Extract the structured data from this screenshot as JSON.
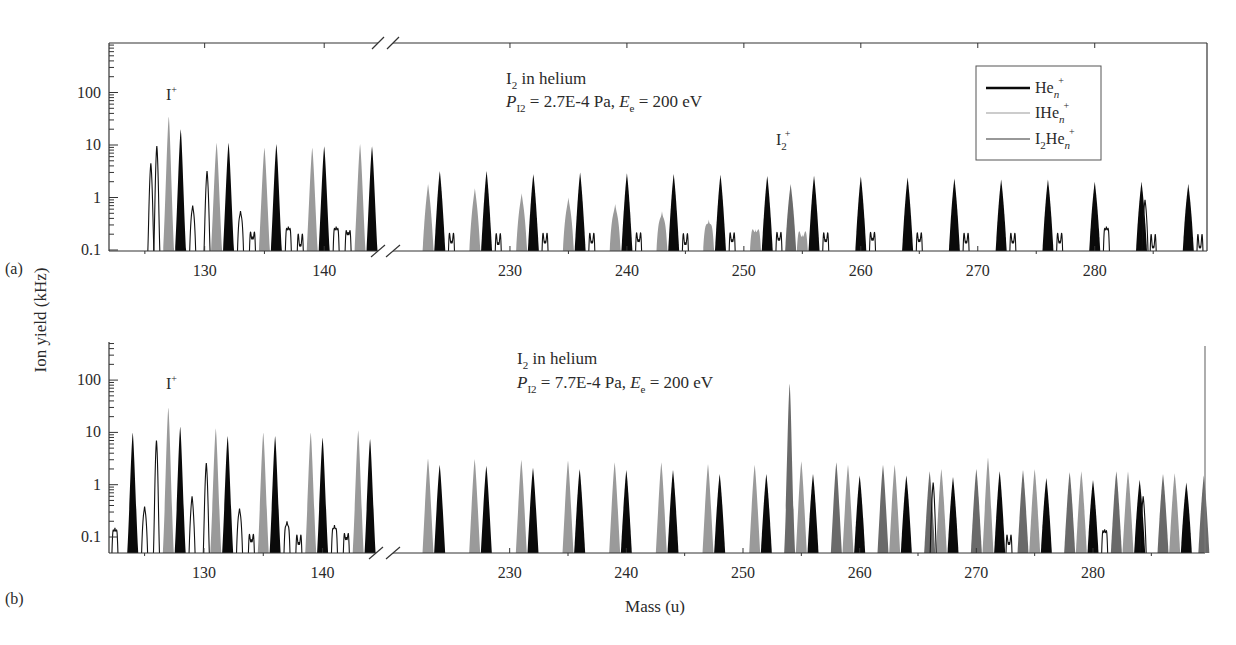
{
  "figure": {
    "ylabel": "Ion yield (kHz)",
    "xlabel": "Mass (u)",
    "colors": {
      "hen": "#0a0a0a",
      "ihen": "#9a9a9a",
      "i2hen": "#6a6a6a",
      "i2hen_outline": "#111111",
      "axis": "#333333"
    }
  },
  "legend": {
    "items": [
      {
        "label": "He",
        "sub": "n",
        "sup": "+",
        "color": "#0a0a0a",
        "width": 2.4
      },
      {
        "label": "IHe",
        "sub": "n",
        "sup": "+",
        "color": "#9a9a9a",
        "width": 1.2
      },
      {
        "label": "I",
        "sub2": "2",
        "label2": "He",
        "sub": "n",
        "sup": "+",
        "color": "#333333",
        "width": 1.2
      }
    ]
  },
  "chart_data": [
    {
      "panel": "(a)",
      "type": "area",
      "title": "I2 in helium",
      "subtitle": "P_I2 = 2.7E-4 Pa, E_e = 200 eV",
      "annotations": [
        "I+",
        "I2+"
      ],
      "xlabel": "Mass (u)",
      "ylabel": "Ion yield (kHz)",
      "yscale": "log",
      "ylim": [
        0.1,
        1000
      ],
      "yticks": [
        "0.1",
        "1",
        "10",
        "100"
      ],
      "x_segments": [
        [
          122,
          144.5
        ],
        [
          220,
          289.6
        ]
      ],
      "xticks": [
        130,
        140,
        230,
        240,
        250,
        260,
        270,
        280
      ],
      "series": [
        {
          "name": "He_n+",
          "style": "black",
          "points": [
            [
              128,
              20
            ],
            [
              132,
              11
            ],
            [
              136,
              10.5
            ],
            [
              140,
              9.5
            ],
            [
              144,
              9.5
            ],
            [
              224,
              3.2
            ],
            [
              228,
              3.2
            ],
            [
              232,
              2.8
            ],
            [
              236,
              3.0
            ],
            [
              240,
              2.9
            ],
            [
              244,
              2.8
            ],
            [
              248,
              2.7
            ],
            [
              252,
              2.6
            ],
            [
              256,
              2.6
            ],
            [
              260,
              2.5
            ],
            [
              264,
              2.4
            ],
            [
              268,
              2.3
            ],
            [
              272,
              2.2
            ],
            [
              276,
              2.2
            ],
            [
              280,
              2.0
            ],
            [
              284,
              2.0
            ],
            [
              288,
              1.8
            ]
          ]
        },
        {
          "name": "IHe_n+",
          "style": "lightgray",
          "points": [
            [
              127,
              35
            ],
            [
              131,
              11
            ],
            [
              135,
              9
            ],
            [
              139,
              9
            ],
            [
              143,
              10.5
            ],
            [
              223,
              1.8
            ],
            [
              227,
              1.5
            ],
            [
              231,
              1.2
            ],
            [
              235,
              1.0
            ],
            [
              239,
              0.75
            ],
            [
              243,
              0.55
            ],
            [
              247,
              0.38
            ],
            [
              251,
              0.25
            ],
            [
              255,
              0.2
            ]
          ]
        },
        {
          "name": "I2He_n+",
          "style": "outline",
          "points": [
            [
              125.5,
              4.5
            ],
            [
              126,
              9.5
            ],
            [
              129,
              0.7
            ],
            [
              130.2,
              3.2
            ],
            [
              133,
              0.55
            ],
            [
              134,
              0.18
            ],
            [
              137,
              0.28
            ],
            [
              138,
              0.13
            ],
            [
              141,
              0.28
            ],
            [
              142,
              0.22
            ],
            [
              225,
              0.15
            ],
            [
              229,
              0.14
            ],
            [
              233,
              0.15
            ],
            [
              237,
              0.15
            ],
            [
              241,
              0.16
            ],
            [
              245,
              0.14
            ],
            [
              249,
              0.16
            ],
            [
              253,
              0.17
            ],
            [
              257,
              0.16
            ],
            [
              261,
              0.17
            ],
            [
              265,
              0.16
            ],
            [
              269,
              0.15
            ],
            [
              273,
              0.15
            ],
            [
              277,
              0.15
            ],
            [
              281,
              0.28
            ],
            [
              285,
              0.12
            ],
            [
              289,
              0.12
            ]
          ]
        },
        {
          "name": "I2+",
          "style": "darkgray",
          "points": [
            [
              254,
              1.8
            ]
          ]
        },
        {
          "name": "I2+ side",
          "style": "outline",
          "points": [
            [
              284.3,
              0.9
            ]
          ]
        }
      ]
    },
    {
      "panel": "(b)",
      "type": "area",
      "title": "I2 in helium",
      "subtitle": "P_I2 = 7.7E-4 Pa, E_e = 200 eV",
      "annotations": [
        "I+"
      ],
      "xlabel": "Mass (u)",
      "ylabel": "Ion yield (kHz)",
      "yscale": "log",
      "ylim": [
        0.05,
        500
      ],
      "yticks": [
        "0.1",
        "1",
        "10",
        "100"
      ],
      "x_segments": [
        [
          122,
          144.5
        ],
        [
          220,
          289.6
        ]
      ],
      "xticks": [
        130,
        140,
        230,
        240,
        250,
        260,
        270,
        280
      ],
      "series": [
        {
          "name": "He_n+",
          "style": "black",
          "points": [
            [
              124,
              10
            ],
            [
              128,
              13
            ],
            [
              132,
              8.5
            ],
            [
              136,
              8.5
            ],
            [
              140,
              8
            ],
            [
              144,
              7.5
            ],
            [
              224,
              2.4
            ],
            [
              228,
              2.3
            ],
            [
              232,
              2.1
            ],
            [
              236,
              2.0
            ],
            [
              240,
              1.9
            ],
            [
              244,
              1.9
            ],
            [
              248,
              1.6
            ],
            [
              252,
              1.6
            ],
            [
              256,
              1.6
            ],
            [
              260,
              1.5
            ],
            [
              264,
              1.5
            ],
            [
              268,
              1.4
            ],
            [
              272,
              1.8
            ],
            [
              276,
              1.35
            ],
            [
              280,
              1.25
            ],
            [
              284,
              1.25
            ],
            [
              288,
              1.1
            ]
          ]
        },
        {
          "name": "IHe_n+",
          "style": "lightgray",
          "points": [
            [
              127,
              30
            ],
            [
              131,
              12
            ],
            [
              135,
              10
            ],
            [
              139,
              10
            ],
            [
              143,
              11
            ],
            [
              223,
              3.2
            ],
            [
              227,
              3.1
            ],
            [
              231,
              3.0
            ],
            [
              235,
              2.9
            ],
            [
              239,
              2.7
            ],
            [
              243,
              2.7
            ],
            [
              247,
              2.5
            ],
            [
              251,
              2.4
            ],
            [
              255,
              2.8
            ],
            [
              259,
              2.4
            ],
            [
              263,
              2.4
            ],
            [
              267,
              2.0
            ],
            [
              271,
              3.3
            ],
            [
              275,
              2.0
            ],
            [
              279,
              1.8
            ],
            [
              283,
              1.8
            ],
            [
              287,
              1.65
            ]
          ]
        },
        {
          "name": "I2He_n+",
          "style": "darkgray",
          "points": [
            [
              254,
              85
            ],
            [
              258,
              2.7
            ],
            [
              262,
              2.4
            ],
            [
              266,
              1.8
            ],
            [
              270,
              2.0
            ],
            [
              274,
              1.9
            ],
            [
              278,
              1.75
            ],
            [
              282,
              1.8
            ],
            [
              286,
              1.6
            ],
            [
              289.5,
              1.5
            ]
          ]
        },
        {
          "name": "I2He_n+ (low)",
          "style": "outline",
          "points": [
            [
              122.5,
              0.15
            ],
            [
              125,
              0.38
            ],
            [
              126,
              7
            ],
            [
              129,
              0.6
            ],
            [
              130.2,
              2.6
            ],
            [
              133,
              0.35
            ],
            [
              134,
              0.09
            ],
            [
              137,
              0.2
            ],
            [
              138,
              0.08
            ],
            [
              141,
              0.17
            ],
            [
              142,
              0.1
            ],
            [
              266.3,
              1.1
            ],
            [
              272.8,
              0.08
            ],
            [
              281,
              0.14
            ],
            [
              284.3,
              0.6
            ]
          ]
        }
      ]
    }
  ],
  "panels": [
    {
      "id": "a",
      "label": "(a)",
      "title_main": "I",
      "title_sub": "2",
      "title_rest": " in helium",
      "cond_p": "P",
      "cond_psub": "I2",
      "cond_rest1": " = 2.7E-4 Pa, ",
      "cond_e": "E",
      "cond_esub": "e",
      "cond_rest2": " = 200 eV",
      "iplus": "I",
      "iplus_sup": "+",
      "i2plus": "I",
      "i2plus_sub": "2",
      "i2plus_sup": "+"
    },
    {
      "id": "b",
      "label": "(b)",
      "title_main": "I",
      "title_sub": "2",
      "title_rest": " in helium",
      "cond_p": "P",
      "cond_psub": "I2",
      "cond_rest1": " = 7.7E-4 Pa, ",
      "cond_e": "E",
      "cond_esub": "e",
      "cond_rest2": " = 200 eV",
      "iplus": "I",
      "iplus_sup": "+"
    }
  ]
}
